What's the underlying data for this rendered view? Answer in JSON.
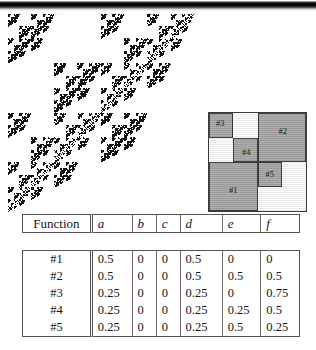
{
  "figure": {
    "kind": "ifs-attractor-figure",
    "scan_band": "dark-scan-edge"
  },
  "attractor": {
    "name": "ifs-fractal-attractor",
    "point_color": "#141414",
    "background": "#ffffff",
    "iterations_depth": 7
  },
  "ifs_diagram": {
    "name": "ifs-unit-square-diagram",
    "fill_color": "#a9a9a9",
    "stroke_color": "#3a3a3a",
    "background": "#ffffff",
    "cells": [
      {
        "id": "cell-1",
        "label": "#1",
        "x": 0.0,
        "y": 0.0,
        "w": 0.5,
        "h": 0.5
      },
      {
        "id": "cell-2",
        "label": "#2",
        "x": 0.5,
        "y": 0.5,
        "w": 0.5,
        "h": 0.5
      },
      {
        "id": "cell-3",
        "label": "#3",
        "x": 0.0,
        "y": 0.75,
        "w": 0.25,
        "h": 0.25
      },
      {
        "id": "cell-4",
        "label": "#4",
        "x": 0.25,
        "y": 0.5,
        "w": 0.25,
        "h": 0.25
      },
      {
        "id": "cell-5",
        "label": "#5",
        "x": 0.5,
        "y": 0.25,
        "w": 0.25,
        "h": 0.25
      }
    ]
  },
  "table": {
    "name": "affine-coefficients-table",
    "headers": [
      "Function",
      "a",
      "b",
      "c",
      "d",
      "e",
      "f"
    ],
    "rows": [
      {
        "function": "#1",
        "a": "0.5",
        "b": "0",
        "c": "0",
        "d": "0.5",
        "e": "0",
        "f": "0"
      },
      {
        "function": "#2",
        "a": "0.5",
        "b": "0",
        "c": "0",
        "d": "0.5",
        "e": "0.5",
        "f": "0.5"
      },
      {
        "function": "#3",
        "a": "0.25",
        "b": "0",
        "c": "0",
        "d": "0.25",
        "e": "0",
        "f": "0.75"
      },
      {
        "function": "#4",
        "a": "0.25",
        "b": "0",
        "c": "0",
        "d": "0.25",
        "e": "0.25",
        "f": "0.5"
      },
      {
        "function": "#5",
        "a": "0.25",
        "b": "0",
        "c": "0",
        "d": "0.25",
        "e": "0.5",
        "f": "0.25"
      }
    ]
  }
}
